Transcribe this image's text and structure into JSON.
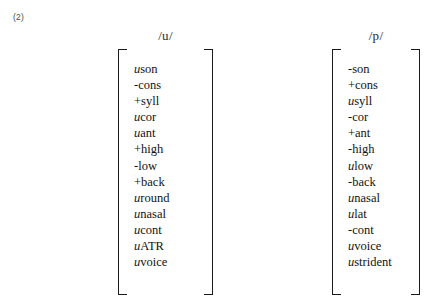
{
  "example_number": "(2)",
  "matrices": [
    {
      "id": "u",
      "header": "/u/",
      "features": [
        {
          "value": "u",
          "value_type": "variable",
          "name": "son"
        },
        {
          "value": "-",
          "value_type": "sign",
          "name": "cons"
        },
        {
          "value": "+",
          "value_type": "sign",
          "name": "syll"
        },
        {
          "value": "u",
          "value_type": "variable",
          "name": "cor"
        },
        {
          "value": "u",
          "value_type": "variable",
          "name": "ant"
        },
        {
          "value": "+",
          "value_type": "sign",
          "name": "high"
        },
        {
          "value": "-",
          "value_type": "sign",
          "name": "low"
        },
        {
          "value": "+",
          "value_type": "sign",
          "name": "back"
        },
        {
          "value": "u",
          "value_type": "variable",
          "name": "round"
        },
        {
          "value": "u",
          "value_type": "variable",
          "name": "nasal"
        },
        {
          "value": "u",
          "value_type": "variable",
          "name": "cont"
        },
        {
          "value": "u",
          "value_type": "variable",
          "name": "ATR"
        },
        {
          "value": "u",
          "value_type": "variable",
          "name": "voice"
        }
      ]
    },
    {
      "id": "p",
      "header": "/p/",
      "features": [
        {
          "value": "-",
          "value_type": "sign",
          "name": "son"
        },
        {
          "value": "+",
          "value_type": "sign",
          "name": "cons"
        },
        {
          "value": "u",
          "value_type": "variable",
          "name": "syll"
        },
        {
          "value": "-",
          "value_type": "sign",
          "name": "cor"
        },
        {
          "value": "+",
          "value_type": "sign",
          "name": "ant"
        },
        {
          "value": "-",
          "value_type": "sign",
          "name": "high"
        },
        {
          "value": "u",
          "value_type": "variable",
          "name": "low"
        },
        {
          "value": "-",
          "value_type": "sign",
          "name": "back"
        },
        {
          "value": "u",
          "value_type": "variable",
          "name": "nasal"
        },
        {
          "value": "u",
          "value_type": "variable",
          "name": "lat"
        },
        {
          "value": "-",
          "value_type": "sign",
          "name": "cont"
        },
        {
          "value": "u",
          "value_type": "variable",
          "name": "voice"
        },
        {
          "value": "u",
          "value_type": "variable",
          "name": "strident"
        }
      ]
    }
  ]
}
